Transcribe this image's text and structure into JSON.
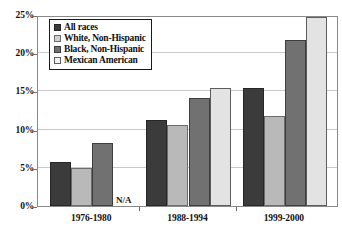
{
  "chart_data": {
    "type": "bar",
    "title": "",
    "subtitle": "",
    "xlabel": "",
    "ylabel": "",
    "categories": [
      "1976-1980",
      "1988-1994",
      "1999-2000"
    ],
    "series": [
      {
        "name": "All races",
        "color": "#3b3b3b",
        "values": [
          5.7,
          11.3,
          15.5
        ]
      },
      {
        "name": "White, Non-Hispanic",
        "color": "#b9b9b9",
        "values": [
          5.0,
          10.6,
          11.8
        ]
      },
      {
        "name": "Black, Non-Hispanic",
        "color": "#717171",
        "values": [
          8.3,
          14.2,
          21.7
        ]
      },
      {
        "name": "Mexican American",
        "color": "#e3e3e3",
        "values": [
          null,
          15.5,
          24.8
        ]
      }
    ],
    "missing_label": "N/A",
    "ylim": [
      0,
      25
    ],
    "yticks": [
      0,
      5,
      10,
      15,
      20,
      25
    ],
    "ytick_labels": [
      "0%",
      "5%",
      "10%",
      "15%",
      "20%",
      "25%"
    ],
    "grid": true,
    "legend_position": "top-left",
    "legend_entries": [
      "All races",
      "White, Non-Hispanic",
      "Black, Non-Hispanic",
      "Mexican American"
    ]
  }
}
